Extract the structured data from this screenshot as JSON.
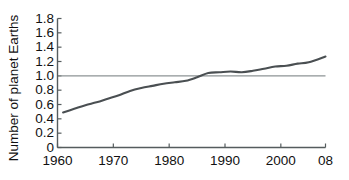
{
  "chart_data": {
    "type": "line",
    "title": "",
    "subtitle": "",
    "xlabel": "",
    "ylabel": "Number of planet Earths",
    "xlim": [
      1960,
      2008
    ],
    "ylim": [
      0,
      1.8
    ],
    "grid": false,
    "reference_lines": [
      {
        "axis": "y",
        "value": 1.0,
        "label": ""
      }
    ],
    "legend": null,
    "legend_position": "none",
    "xticks": [
      1960,
      1970,
      1980,
      1990,
      2000,
      2008
    ],
    "xtick_labels": [
      "1960",
      "1970",
      "1980",
      "1990",
      "2000",
      "08"
    ],
    "yticks": [
      0,
      0.2,
      0.4,
      0.6,
      0.8,
      1.0,
      1.2,
      1.4,
      1.6,
      1.8
    ],
    "ytick_labels": [
      "0",
      "0.2",
      "0.4",
      "0.6",
      "0.8",
      "1.0",
      "1.2",
      "1.4",
      "1.6",
      "1.8"
    ],
    "series": [
      {
        "name": "Ecological footprint",
        "color": "#4a4f52",
        "x": [
          1961,
          1963,
          1965,
          1967,
          1969,
          1971,
          1973,
          1975,
          1977,
          1979,
          1981,
          1983,
          1985,
          1987,
          1989,
          1991,
          1993,
          1995,
          1997,
          1999,
          2001,
          2003,
          2005,
          2008
        ],
        "values": [
          0.49,
          0.54,
          0.59,
          0.63,
          0.68,
          0.73,
          0.79,
          0.83,
          0.86,
          0.89,
          0.91,
          0.93,
          0.98,
          1.04,
          1.05,
          1.06,
          1.05,
          1.07,
          1.1,
          1.13,
          1.14,
          1.17,
          1.19,
          1.27
        ]
      }
    ],
    "annotations": []
  },
  "axis_colors": {
    "axis": "#555c5e",
    "gridline": "#8d9395",
    "line": "#4a4f52",
    "text": "#111111",
    "background": "#ffffff"
  }
}
